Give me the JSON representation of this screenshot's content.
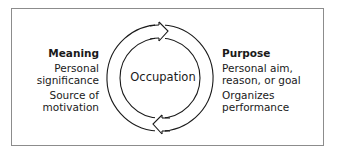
{
  "diagram": {
    "center": {
      "label": "Occupation"
    },
    "left": {
      "title": "Meaning",
      "items": [
        "Personal significance",
        "Source of motivation"
      ],
      "lines": [
        [
          "Personal",
          "significance"
        ],
        [
          "Source of",
          "motivation"
        ]
      ]
    },
    "right": {
      "title": "Purpose",
      "items": [
        "Personal aim, reason, or goal",
        "Organizes performance"
      ],
      "lines": [
        [
          "Personal aim,",
          "reason, or goal"
        ],
        [
          "Organizes",
          "performance"
        ]
      ]
    },
    "colors": {
      "stroke": "#1a1a1a",
      "frame": "#8c8c8c",
      "background": "#ffffff"
    }
  }
}
